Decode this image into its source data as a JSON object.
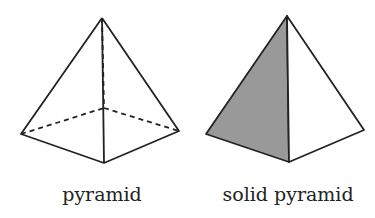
{
  "figures": [
    {
      "label": "pyramid",
      "style": "wireframe with hidden edges dashed",
      "vertices": {
        "apex": [
          102,
          18
        ],
        "left": [
          21,
          134
        ],
        "front": [
          104,
          163
        ],
        "right": [
          179,
          131
        ],
        "back": [
          104,
          108
        ]
      }
    },
    {
      "label": "solid pyramid",
      "style": "solid with shaded left face",
      "vertices": {
        "apex": [
          287,
          16
        ],
        "left": [
          206,
          134
        ],
        "front": [
          289,
          162
        ],
        "right": [
          364,
          130
        ]
      }
    }
  ],
  "colors": {
    "stroke": "#222222",
    "shade": "#999999",
    "background": "#ffffff"
  }
}
